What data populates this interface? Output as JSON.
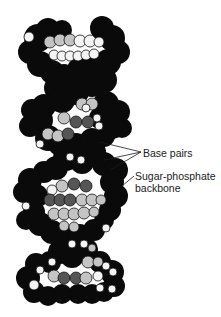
{
  "figure": {
    "colors": {
      "backbone": "#0a0a0a",
      "base_light": "#c4c4c4",
      "base_dark": "#555555",
      "base_white": "#f4f4f4",
      "background": "#ffffff",
      "label_text": "#1a1a1a"
    },
    "labels": {
      "base_pairs": "Base pairs",
      "sugar_phosphate_line1": "Sugar-phosphate",
      "sugar_phosphate_line2": "backbone"
    }
  }
}
